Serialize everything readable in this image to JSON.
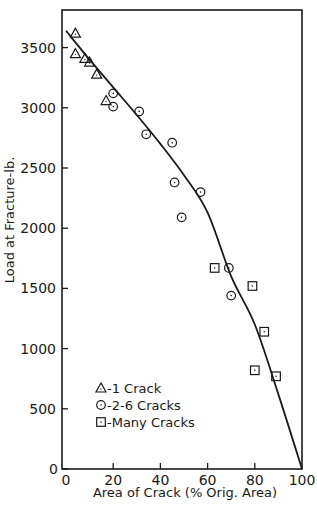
{
  "chart_data": {
    "type": "scatter",
    "title": "",
    "xlabel": "Area of Crack (% Orig. Area)",
    "ylabel": "Load at Fracture-lb.",
    "xlim": [
      0,
      100
    ],
    "ylim": [
      0,
      3700
    ],
    "xticks": [
      0,
      20,
      40,
      60,
      80,
      100
    ],
    "yticks": [
      0,
      500,
      1000,
      1500,
      2000,
      2500,
      3000,
      3500
    ],
    "grid": false,
    "legend_position": "lower left (inside)",
    "series": [
      {
        "name": "1 Crack",
        "marker": "triangle",
        "points": [
          [
            4,
            3620
          ],
          [
            4,
            3450
          ],
          [
            8,
            3410
          ],
          [
            10,
            3380
          ],
          [
            13,
            3280
          ],
          [
            17,
            3060
          ]
        ]
      },
      {
        "name": "2-6 Cracks",
        "marker": "circle",
        "points": [
          [
            20,
            3120
          ],
          [
            20,
            3010
          ],
          [
            31,
            2970
          ],
          [
            34,
            2780
          ],
          [
            45,
            2710
          ],
          [
            46,
            2380
          ],
          [
            49,
            2090
          ],
          [
            57,
            2300
          ],
          [
            69,
            1670
          ],
          [
            70,
            1440
          ]
        ]
      },
      {
        "name": "Many Cracks",
        "marker": "square",
        "points": [
          [
            63,
            1670
          ],
          [
            79,
            1520
          ],
          [
            84,
            1140
          ],
          [
            80,
            820
          ],
          [
            89,
            770
          ]
        ]
      }
    ],
    "fit_curve": {
      "name": "fitted curve",
      "points": [
        [
          0,
          3640
        ],
        [
          10,
          3400
        ],
        [
          20,
          3170
        ],
        [
          30,
          2940
        ],
        [
          40,
          2700
        ],
        [
          50,
          2440
        ],
        [
          60,
          2130
        ],
        [
          70,
          1600
        ],
        [
          80,
          1200
        ],
        [
          90,
          620
        ],
        [
          100,
          0
        ]
      ]
    }
  },
  "legend": {
    "items": [
      {
        "symbol": "triangle",
        "label": "-1 Crack"
      },
      {
        "symbol": "circle",
        "label": "-2-6 Cracks"
      },
      {
        "symbol": "square",
        "label": "-Many Cracks"
      }
    ]
  },
  "axes": {
    "xlabel": "Area of Crack (% Orig. Area)",
    "ylabel": "Load at Fracture-lb.",
    "xtick_labels": [
      "0",
      "20",
      "40",
      "60",
      "80",
      "100"
    ],
    "ytick_labels": [
      "0",
      "500",
      "1000",
      "1500",
      "2000",
      "2500",
      "3000",
      "3500"
    ]
  },
  "colors": {
    "ink": "#1a1a1a",
    "background": "#ffffff"
  }
}
